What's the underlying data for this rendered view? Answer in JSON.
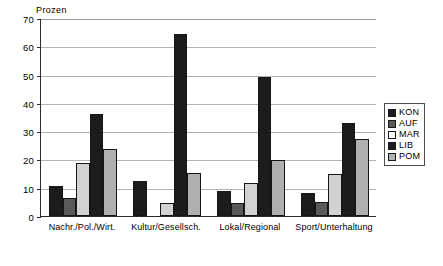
{
  "chart_data": {
    "type": "bar",
    "title": "",
    "ylabel": "Prozen",
    "xlabel": "",
    "ylim": [
      0,
      70
    ],
    "ytick_step": 10,
    "yticks": [
      0,
      10,
      20,
      30,
      40,
      50,
      60,
      70
    ],
    "ytick_labels": [
      "0",
      "10",
      "20",
      "30",
      "40",
      "50",
      "60",
      "70"
    ],
    "grid": true,
    "legend_position": "right",
    "categories": [
      "Nachr./Pol./Wirt.",
      "Kultur/Gesellsch.",
      "Lokal/Regional",
      "Sport/Unterhaltung"
    ],
    "series": [
      {
        "name": "KON",
        "color": "#1c1c1c",
        "values": [
          10.5,
          12.3,
          9.0,
          8.0
        ]
      },
      {
        "name": "AUF",
        "color": "#595959",
        "values": [
          6.3,
          0,
          4.5,
          5.0
        ]
      },
      {
        "name": "MAR",
        "color": "#d2d2d2",
        "values": [
          18.7,
          4.5,
          11.5,
          15.0
        ]
      },
      {
        "name": "LIB",
        "color": "#1c1c1c",
        "values": [
          36.0,
          64.5,
          49.0,
          33.0
        ]
      },
      {
        "name": "POM",
        "color": "#b0b0b0",
        "values": [
          23.7,
          15.2,
          19.7,
          27.3
        ]
      }
    ],
    "legend_entries": [
      {
        "label": "KON",
        "color": "#1c1c1c"
      },
      {
        "label": "AUF",
        "color": "#595959"
      },
      {
        "label": "MAR",
        "color": "#ffffff"
      },
      {
        "label": "LIB",
        "color": "#1c1c1c"
      },
      {
        "label": "POM",
        "color": "#b0b0b0"
      }
    ]
  }
}
